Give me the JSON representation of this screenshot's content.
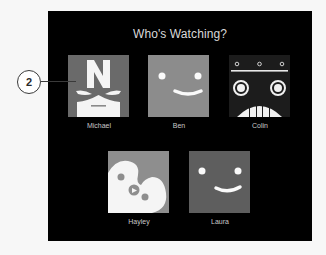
{
  "title": "Who's Watching?",
  "callout": {
    "number": "2"
  },
  "profiles": [
    {
      "name": "Michael",
      "avatar": "superhero-mask-icon",
      "color": "#6a6a6a"
    },
    {
      "name": "Ben",
      "avatar": "smiley-face-icon",
      "color": "#8c8c8c"
    },
    {
      "name": "Colin",
      "avatar": "robot-face-icon",
      "color": "#1c1c1c"
    },
    {
      "name": "Hayley",
      "avatar": "paint-palette-icon",
      "color": "#8e8e8e"
    },
    {
      "name": "Laura",
      "avatar": "smiley-face-icon",
      "color": "#5e5e5e"
    }
  ]
}
